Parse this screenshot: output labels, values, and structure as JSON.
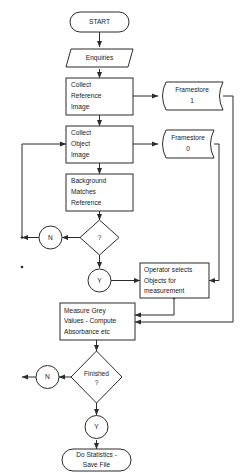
{
  "diagram": {
    "background_color": "#ffffff",
    "stroke_color": "#2b2b2b",
    "text_color": "#1a1a1a",
    "nodes": {
      "start": {
        "label": "START",
        "shape": "terminator"
      },
      "enquiries": {
        "label": "Enquiries",
        "shape": "parallelogram"
      },
      "collect_reference": {
        "line1": "Collect",
        "line2": "Reference",
        "line3": "Image",
        "shape": "process"
      },
      "framestore1": {
        "line1": "Framestore",
        "line2": "1",
        "shape": "stored-data"
      },
      "collect_object": {
        "line1": "Collect",
        "line2": "Object",
        "line3": "Image",
        "shape": "process"
      },
      "framestore0": {
        "line1": "Framestore",
        "line2": "0",
        "shape": "stored-data"
      },
      "background_matches": {
        "line1": "Background",
        "line2": "Matches",
        "line3": "Reference",
        "shape": "process"
      },
      "decision_match": {
        "label": "?",
        "shape": "decision"
      },
      "match_no": {
        "label": "N",
        "shape": "connector"
      },
      "match_yes": {
        "label": "Y",
        "shape": "connector"
      },
      "operator_selects": {
        "line1": "Operator selects",
        "line2": "Objects for",
        "line3": "measurement",
        "shape": "process"
      },
      "measure_grey": {
        "line1": "Measure Grey",
        "line2": "Values - Compute",
        "line3": "Absorbance etc",
        "shape": "process"
      },
      "decision_finished": {
        "line1": "Finished",
        "line2": "?",
        "shape": "decision"
      },
      "finished_no": {
        "label": "N",
        "shape": "connector"
      },
      "finished_yes": {
        "label": "Y",
        "shape": "connector"
      },
      "do_statistics": {
        "line1": "Do Statistics -",
        "line2": "Save File",
        "shape": "terminator"
      }
    }
  }
}
